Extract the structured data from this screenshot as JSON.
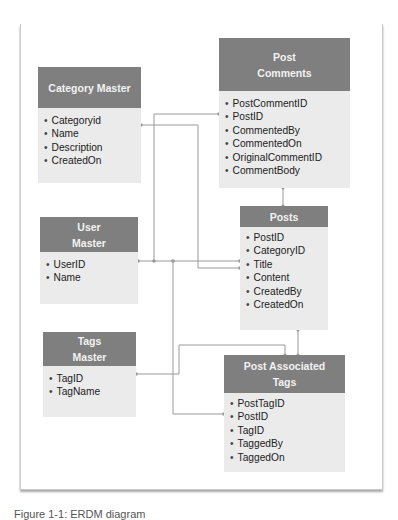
{
  "diagram": {
    "type": "entity-relationship",
    "entities": [
      {
        "id": "category-master",
        "title": "Category Master",
        "fields": [
          "Categoryid",
          "Name",
          "Description",
          "CreatedOn"
        ]
      },
      {
        "id": "post-comments",
        "title": "Post\nComments",
        "title_lines": [
          "Post",
          "Comments"
        ],
        "fields": [
          "PostCommentID",
          "PostID",
          "CommentedBy",
          "CommentedOn",
          "OriginalCommentID",
          "CommentBody"
        ]
      },
      {
        "id": "user-master",
        "title_lines": [
          "User",
          "Master"
        ],
        "fields": [
          "UserID",
          "Name"
        ]
      },
      {
        "id": "posts",
        "title": "Posts",
        "fields": [
          "PostID",
          "CategoryID",
          "Title",
          "Content",
          "CreatedBy",
          "CreatedOn"
        ]
      },
      {
        "id": "tags-master",
        "title_lines": [
          "Tags",
          "Master"
        ],
        "fields": [
          "TagID",
          "TagName"
        ]
      },
      {
        "id": "post-associated-tags",
        "title_lines": [
          "Post Associated",
          "Tags"
        ],
        "fields": [
          "PostTagID",
          "PostID",
          "TagID",
          "TaggedBy",
          "TaggedOn"
        ]
      }
    ],
    "relationships": [
      {
        "from": "Category Master.Categoryid",
        "to": "Posts.CategoryID"
      },
      {
        "from": "User Master.UserID",
        "to": "Post Comments.PostID"
      },
      {
        "from": "User Master.UserID",
        "to": "Posts.Title"
      },
      {
        "from": "User Master.UserID",
        "to": "Post Associated Tags.PostID"
      },
      {
        "from": "Post Comments",
        "to": "Posts"
      },
      {
        "from": "Posts",
        "to": "Post Associated Tags"
      },
      {
        "from": "Tags Master.TagID",
        "to": "Post Associated Tags"
      }
    ],
    "colors": {
      "header_bg": "#7f7f7f",
      "header_text": "#f2f2f2",
      "body_bg": "#ebebeb",
      "connector": "#9a9a9a"
    }
  },
  "caption": "Figure 1-1: ERDM diagram"
}
